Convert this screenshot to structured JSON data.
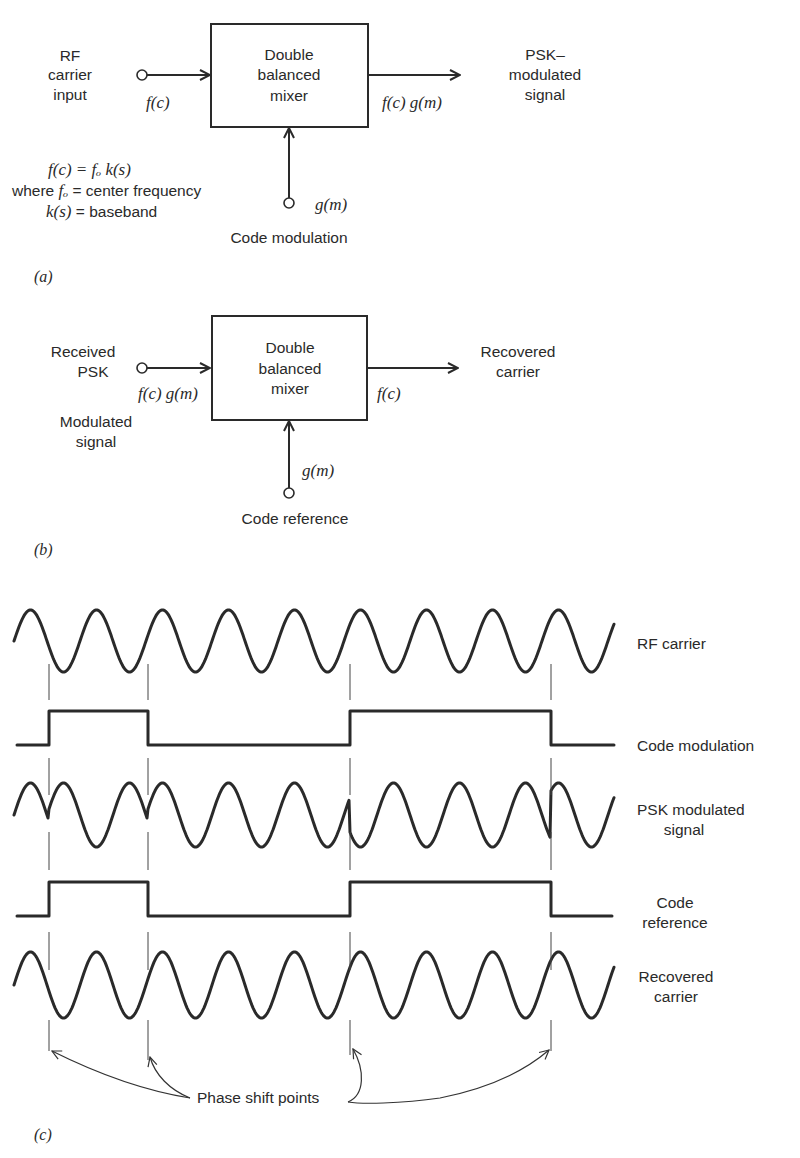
{
  "figure_a": {
    "caption": "(a)",
    "input_label": [
      "RF",
      "carrier",
      "input"
    ],
    "input_signal": "f(c)",
    "block_label": [
      "Double",
      "balanced",
      "mixer"
    ],
    "output_signal": "f(c) g(m)",
    "output_label": [
      "PSK–",
      "modulated",
      "signal"
    ],
    "control_signal": "g(m)",
    "control_label": "Code modulation",
    "equation": {
      "line1": "f(c) = fₒ k(s)",
      "line2_prefix": "where ",
      "line2_var": "fₒ",
      "line2_rest": " = center frequency",
      "line3_var": "k(s)",
      "line3_rest": " = baseband"
    }
  },
  "figure_b": {
    "caption": "(b)",
    "input_label": [
      "Received",
      "PSK"
    ],
    "input_label_sub": [
      "Modulated",
      "signal"
    ],
    "input_signal": "f(c) g(m)",
    "block_label": [
      "Double",
      "balanced",
      "mixer"
    ],
    "output_signal": "f(c)",
    "output_label": [
      "Recovered",
      "carrier"
    ],
    "control_signal": "g(m)",
    "control_label": "Code reference"
  },
  "figure_c": {
    "caption": "(c)",
    "traces": [
      {
        "id": "rf-carrier",
        "label": [
          "RF carrier"
        ]
      },
      {
        "id": "code-modulation",
        "label": [
          "Code modulation"
        ]
      },
      {
        "id": "psk-signal",
        "label": [
          "PSK modulated",
          "signal"
        ]
      },
      {
        "id": "code-reference",
        "label": [
          "Code",
          "reference"
        ]
      },
      {
        "id": "recovered-carrier",
        "label": [
          "Recovered",
          "carrier"
        ]
      }
    ],
    "annotation": "Phase shift points",
    "phase_shift_x": [
      49,
      148,
      350,
      551
    ],
    "code_bits": [
      0,
      1,
      0,
      0,
      1,
      0
    ]
  },
  "colors": {
    "ink": "#2a2a2a",
    "background": "#ffffff"
  }
}
